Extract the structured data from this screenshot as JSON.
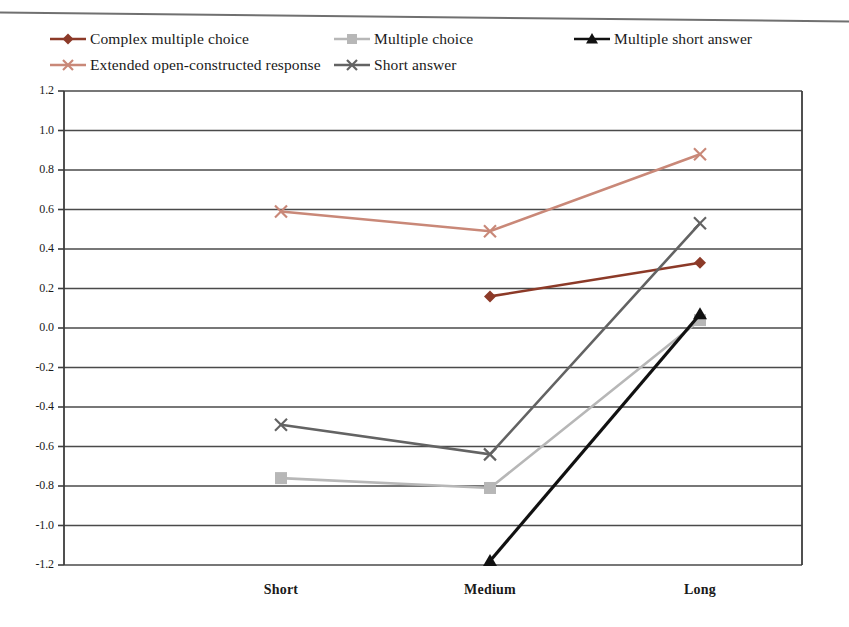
{
  "chart_data": {
    "type": "line",
    "title": "",
    "subtitle": "",
    "xlabel": "",
    "ylabel": "",
    "categories": [
      "Short",
      "Medium",
      "Long"
    ],
    "ylim": [
      -1.2,
      1.2
    ],
    "ytick_labels": [
      "1.2",
      "1.0",
      "0.8",
      "0.6",
      "0.4",
      "0.2",
      "0.0",
      "-0.2",
      "-0.4",
      "-0.6",
      "-0.8",
      "-1.0",
      "-1.2"
    ],
    "ytick_values": [
      1.2,
      1.0,
      0.8,
      0.6,
      0.4,
      0.2,
      0.0,
      -0.2,
      -0.4,
      -0.6,
      -0.8,
      -1.0,
      -1.2
    ],
    "grid": true,
    "legend_position": "top",
    "series": [
      {
        "name": "Complex multiple choice",
        "color": "#8c3a28",
        "marker": "diamond",
        "x": [
          "Medium",
          "Long"
        ],
        "values": [
          0.16,
          0.33
        ]
      },
      {
        "name": "Extended open-constructed response",
        "color": "#c98878",
        "marker": "x",
        "x": [
          "Short",
          "Medium",
          "Long"
        ],
        "values": [
          0.59,
          0.49,
          0.88
        ]
      },
      {
        "name": "Multiple choice",
        "color": "#b7b7b7",
        "marker": "square",
        "x": [
          "Short",
          "Medium",
          "Long"
        ],
        "values": [
          -0.76,
          -0.81,
          0.04
        ]
      },
      {
        "name": "Short answer",
        "color": "#636363",
        "marker": "x",
        "x": [
          "Short",
          "Medium",
          "Long"
        ],
        "values": [
          -0.49,
          -0.64,
          0.53
        ]
      },
      {
        "name": "Multiple short answer",
        "color": "#111111",
        "marker": "triangle",
        "x": [
          "Medium",
          "Long"
        ],
        "values": [
          -1.18,
          0.07
        ]
      }
    ]
  },
  "legend": {
    "items": [
      {
        "label": "Complex multiple choice",
        "color": "#8c3a28",
        "marker": "diamond",
        "icon": "legend-key-diamond-icon"
      },
      {
        "label": "Multiple choice",
        "color": "#b7b7b7",
        "marker": "square",
        "icon": "legend-key-square-icon"
      },
      {
        "label": "Multiple short answer",
        "color": "#111111",
        "marker": "triangle",
        "icon": "legend-key-triangle-icon"
      },
      {
        "label": "Extended open-constructed response",
        "color": "#c98878",
        "marker": "x",
        "icon": "legend-key-x-icon"
      },
      {
        "label": "Short answer",
        "color": "#636363",
        "marker": "x",
        "icon": "legend-key-x-icon"
      }
    ]
  },
  "axes": {
    "x_categories": [
      "Short",
      "Medium",
      "Long"
    ],
    "y_labels": [
      "1.2",
      "1.0",
      "0.8",
      "0.6",
      "0.4",
      "0.2",
      "0.0",
      "-0.2",
      "-0.4",
      "-0.6",
      "-0.8",
      "-1.0",
      "-1.2"
    ]
  },
  "colors": {
    "complex_multiple_choice": "#8c3a28",
    "extended_open_constructed_response": "#c98878",
    "multiple_choice": "#b7b7b7",
    "short_answer": "#636363",
    "multiple_short_answer": "#111111",
    "axis": "#3d3d3d",
    "grid": "#4a4a4a",
    "background": "#ffffff"
  }
}
